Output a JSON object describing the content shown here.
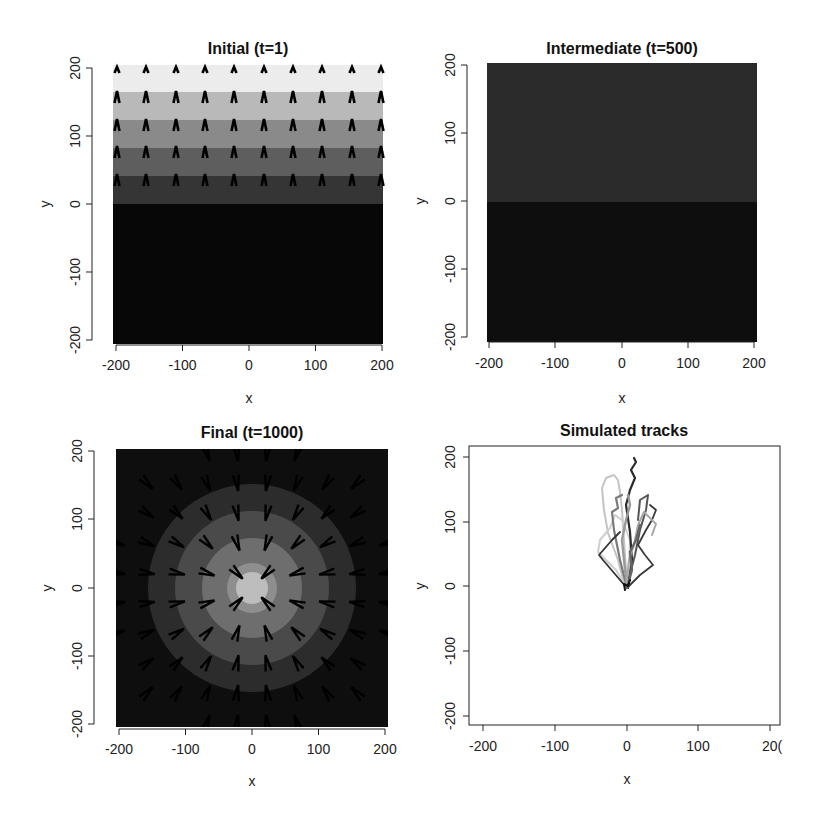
{
  "chart_data": [
    {
      "type": "heatmap",
      "title": "Initial (t=1)",
      "xlabel": "x",
      "ylabel": "y",
      "xlim": [
        -200,
        200
      ],
      "ylim": [
        -200,
        200
      ],
      "xticks": [
        "-200",
        "-100",
        "0",
        "100",
        "200"
      ],
      "yticks": [
        "-200",
        "-100",
        "0",
        "100",
        "200"
      ],
      "bands": [
        {
          "y_from": 160,
          "y_to": 200,
          "color": "#ececec"
        },
        {
          "y_from": 120,
          "y_to": 160,
          "color": "#b9b9b9"
        },
        {
          "y_from": 80,
          "y_to": 120,
          "color": "#8a8a8a"
        },
        {
          "y_from": 40,
          "y_to": 80,
          "color": "#5e5e5e"
        },
        {
          "y_from": 0,
          "y_to": 40,
          "color": "#353535"
        },
        {
          "y_from": -200,
          "y_to": 0,
          "color": "#070707"
        }
      ],
      "arrows": "upward-pointing vector field on a 10x5 grid in upper half (y>0)"
    },
    {
      "type": "heatmap",
      "title": "Intermediate (t=500)",
      "xlabel": "x",
      "ylabel": "y",
      "xlim": [
        -200,
        200
      ],
      "ylim": [
        -200,
        200
      ],
      "xticks": [
        "-200",
        "-100",
        "0",
        "100",
        "200"
      ],
      "yticks": [
        "-200",
        "-100",
        "0",
        "100",
        "200"
      ],
      "bands": [
        {
          "y_from": 0,
          "y_to": 200,
          "color": "#2b2b2b"
        },
        {
          "y_from": -200,
          "y_to": 0,
          "color": "#0e0e0e"
        }
      ]
    },
    {
      "type": "heatmap",
      "title": "Final (t=1000)",
      "xlabel": "x",
      "ylabel": "y",
      "xlim": [
        -200,
        200
      ],
      "ylim": [
        -200,
        200
      ],
      "xticks": [
        "-200",
        "-100",
        "0",
        "100",
        "200"
      ],
      "yticks": [
        "-200",
        "-100",
        "0",
        "100",
        "200"
      ],
      "rings": [
        {
          "radius": 200,
          "color": "#0e0e0e"
        },
        {
          "radius": 155,
          "color": "#2c2c2c"
        },
        {
          "radius": 115,
          "color": "#4a4a4a"
        },
        {
          "radius": 75,
          "color": "#6e6e6e"
        },
        {
          "radius": 35,
          "color": "#aaaaaa"
        }
      ],
      "arrows": "vector field pointing inward toward origin (0,0)"
    },
    {
      "type": "line",
      "title": "Simulated tracks",
      "xlabel": "x",
      "ylabel": "y",
      "xlim": [
        -200,
        200
      ],
      "ylim": [
        -200,
        200
      ],
      "xticks": [
        "-200",
        "-100",
        "0",
        "100",
        "200"
      ],
      "yticks": [
        "-200",
        "-100",
        "0",
        "100",
        "200"
      ],
      "series_description": "Multiple grayscale random-walk tracks starting near (0,0) and moving upward to y≈40–195, x within about -40 to 45"
    }
  ],
  "panels": {
    "p1": {
      "title": "Initial (t=1)",
      "xlabel": "x",
      "ylabel": "y"
    },
    "p2": {
      "title": "Intermediate (t=500)",
      "xlabel": "x",
      "ylabel": "y"
    },
    "p3": {
      "title": "Final (t=1000)",
      "xlabel": "x",
      "ylabel": "y"
    },
    "p4": {
      "title": "Simulated tracks",
      "xlabel": "x",
      "ylabel": "y"
    }
  },
  "ticks": {
    "t0": "-200",
    "t1": "-100",
    "t2": "0",
    "t3": "100",
    "t4": "200",
    "t4_clipped": "20("
  }
}
